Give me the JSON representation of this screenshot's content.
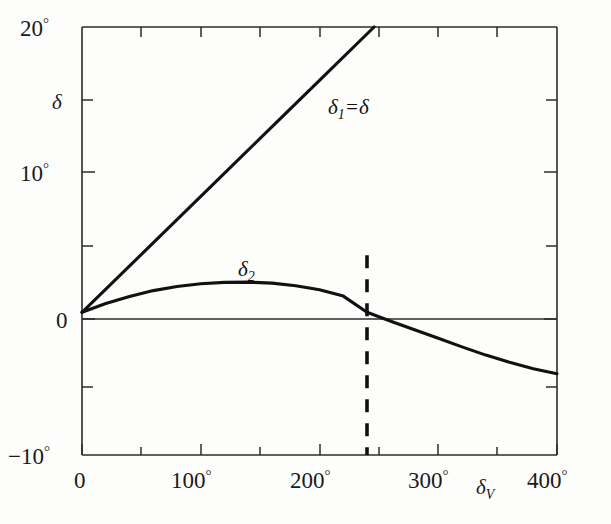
{
  "chart_data": {
    "type": "line",
    "title": "",
    "subtitle": "",
    "xlabel": "δᵥ",
    "ylabel": "δ",
    "xlim": [
      0,
      400
    ],
    "ylim": [
      -10,
      20
    ],
    "grid": false,
    "legend_position": "inline-annotations",
    "x_tick_labels": [
      "0",
      "100°",
      "200°",
      "300°",
      "400°"
    ],
    "x_tick_values": [
      0,
      100,
      200,
      300,
      400
    ],
    "x_minor_tick_values": [
      50,
      150,
      250,
      350
    ],
    "y_tick_labels": [
      "20°",
      "10°",
      "0",
      "−10°"
    ],
    "y_tick_values": [
      20,
      10,
      0,
      -10
    ],
    "y_minor_tick_values": [
      15,
      5,
      -5
    ],
    "series": [
      {
        "name": "δ₁=δ",
        "label": "δ₁=δ",
        "label_x": 246,
        "label_y": 14.5,
        "x": [
          0,
          50,
          100,
          150,
          200,
          246
        ],
        "values": [
          0,
          4.06,
          8.13,
          12.19,
          16.26,
          20.0
        ],
        "note": "straight line through origin, slope 0.0813 deg per deg, exits top of frame at x=246"
      },
      {
        "name": "δ₂",
        "label": "δ₂",
        "label_x": 128,
        "label_y": 4.3,
        "x": [
          0,
          20,
          40,
          60,
          80,
          100,
          120,
          140,
          160,
          180,
          200,
          220,
          240,
          260,
          280,
          300,
          320,
          340,
          360,
          380,
          400
        ],
        "values": [
          0,
          0.62,
          1.12,
          1.52,
          1.81,
          2.0,
          2.1,
          2.12,
          2.05,
          1.87,
          1.58,
          1.14,
          0.0,
          -0.62,
          -1.22,
          -1.82,
          -2.42,
          -3.0,
          -3.5,
          -3.95,
          -4.3
        ],
        "note": "rises to a maximum near 140 deg then falls, crossing zero at about 240 deg"
      }
    ],
    "annotations": [
      {
        "name": "zero-crossing-marker",
        "type": "vertical-dashed-line",
        "x": 240,
        "y_from": -10,
        "y_to": 4.0
      },
      {
        "name": "zero-axis",
        "type": "horizontal-line",
        "y": 0
      }
    ]
  },
  "labels": {
    "y_axis_name": "δ",
    "x_axis_name_base": "δ",
    "x_axis_name_sub": "V",
    "curve1_base": "δ",
    "curve1_sub": "1",
    "curve1_rest": "=δ",
    "curve2_base": "δ",
    "curve2_sub": "2",
    "y_top": "20",
    "y_top_deg": "°",
    "y_mid": "10",
    "y_mid_deg": "°",
    "y_zero": "0",
    "y_bottom": "−10",
    "y_bottom_deg": "°",
    "x_0": "0",
    "x_100": "100",
    "x_100_deg": "°",
    "x_200": "200",
    "x_200_deg": "°",
    "x_300": "300",
    "x_300_deg": "°",
    "x_400": "400",
    "x_400_deg": "°"
  },
  "colors": {
    "background": "#fdfdfb",
    "axis": "#2b2b2b",
    "curve": "#111111",
    "text": "#1a1a1a"
  }
}
